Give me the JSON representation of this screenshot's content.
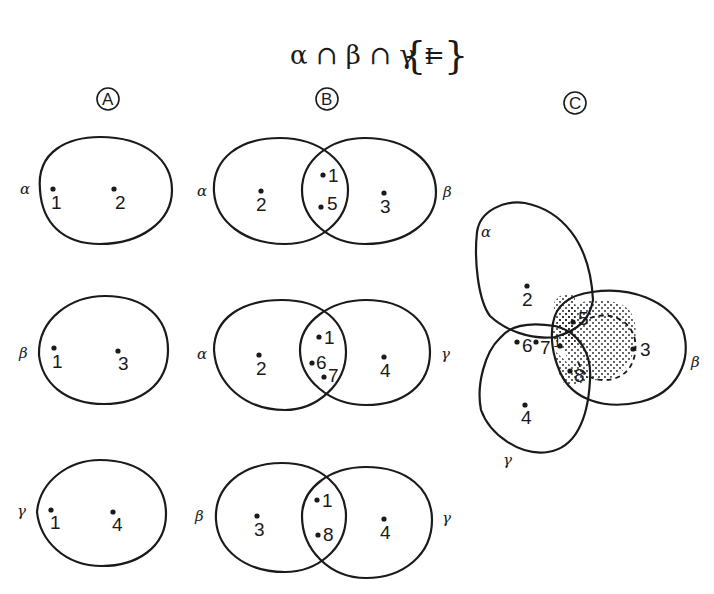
{
  "equation": {
    "lhs": "α ∩ β ∩ γ =",
    "open_brace": "{",
    "element": "I",
    "close_brace": "}"
  },
  "panels": {
    "A": {
      "label": "A"
    },
    "B": {
      "label": "B"
    },
    "C": {
      "label": "C"
    }
  },
  "sets": {
    "alpha": "α",
    "beta": "β",
    "gamma": "γ"
  },
  "panel_a": {
    "row1": {
      "set": "α",
      "points": [
        "1",
        "2"
      ]
    },
    "row2": {
      "set": "β",
      "points": [
        "1",
        "3"
      ]
    },
    "row3": {
      "set": "γ",
      "points": [
        "1",
        "4"
      ]
    }
  },
  "panel_b": {
    "row1": {
      "left_set": "α",
      "right_set": "β",
      "left_only": [
        "2"
      ],
      "intersection": [
        "1",
        "5"
      ],
      "right_only": [
        "3"
      ]
    },
    "row2": {
      "left_set": "α",
      "right_set": "γ",
      "left_only": [
        "2"
      ],
      "intersection": [
        "1",
        "6",
        "7"
      ],
      "right_only": [
        "4"
      ]
    },
    "row3": {
      "left_set": "β",
      "right_set": "γ",
      "left_only": [
        "3"
      ],
      "intersection": [
        "1",
        "8"
      ],
      "right_only": [
        "4"
      ]
    }
  },
  "panel_c": {
    "alpha_label": "α",
    "beta_label": "β",
    "gamma_label": "γ",
    "points": {
      "p2": "2",
      "p5": "5",
      "p6": "6",
      "p7": "7",
      "p1": "1",
      "p8": "8",
      "p3": "3",
      "p4": "4"
    },
    "shaded_region": "dotted"
  }
}
